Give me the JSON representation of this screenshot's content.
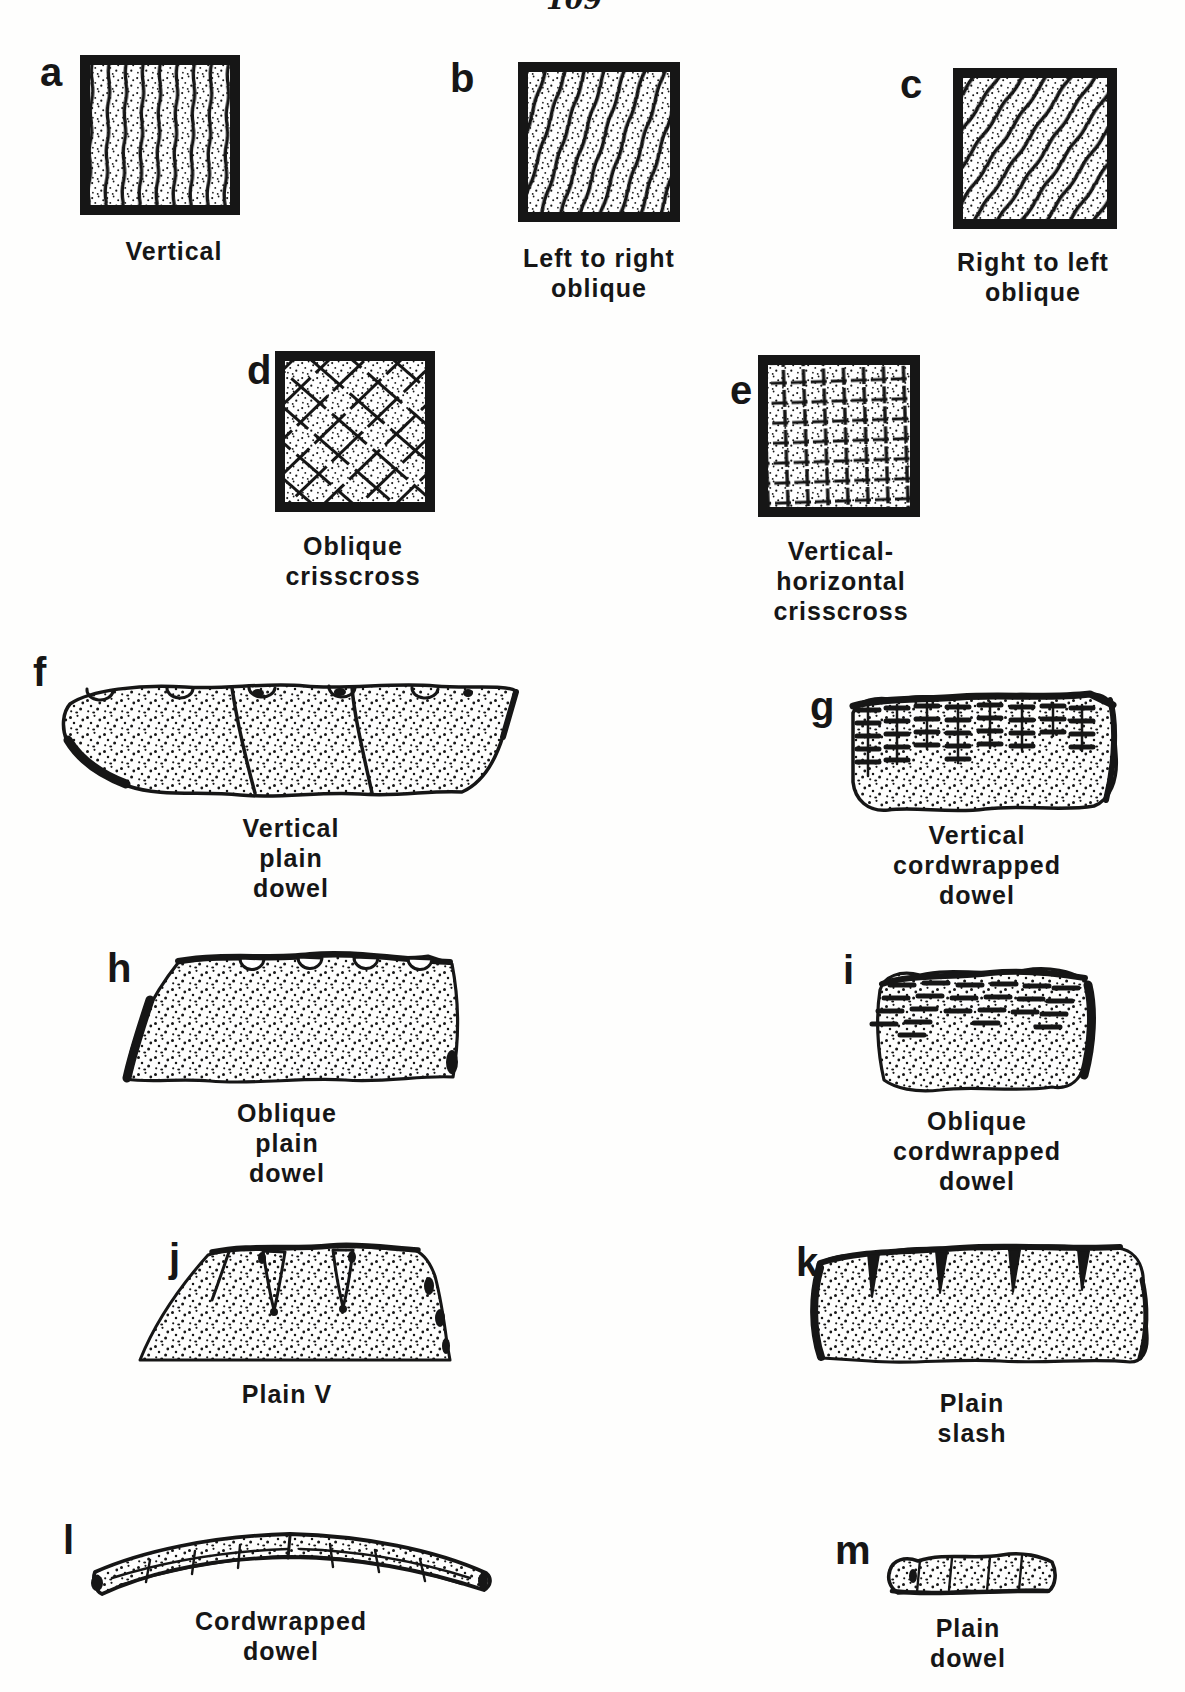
{
  "page": {
    "paper_color": "#fefefd",
    "ink_color": "#161616",
    "page_mark": "109"
  },
  "figure": {
    "panels": [
      {
        "letter": "a",
        "kind": "square-swatch",
        "pattern": "vertical-lines",
        "caption_lines": [
          "Vertical"
        ]
      },
      {
        "letter": "b",
        "kind": "square-swatch",
        "pattern": "steep-oblique-lines",
        "caption_lines": [
          "Left to right",
          "oblique"
        ]
      },
      {
        "letter": "c",
        "kind": "square-swatch",
        "pattern": "oblique-lines",
        "caption_lines": [
          "Right to left",
          "oblique"
        ]
      },
      {
        "letter": "d",
        "kind": "square-swatch",
        "pattern": "diagonal-crisscross",
        "caption_lines": [
          "Oblique",
          "crisscross"
        ]
      },
      {
        "letter": "e",
        "kind": "square-swatch",
        "pattern": "vertical-horizontal-grid",
        "caption_lines": [
          "Vertical-",
          "horizontal",
          "crisscross"
        ]
      },
      {
        "letter": "f",
        "kind": "rim-sherd",
        "pattern": "plain-dowel-impressions-vertical",
        "caption_lines": [
          "Vertical",
          "plain",
          "dowel"
        ]
      },
      {
        "letter": "g",
        "kind": "rim-sherd",
        "pattern": "cordwrapped-dowel-impressions-vertical",
        "caption_lines": [
          "Vertical",
          "cordwrapped",
          "dowel"
        ]
      },
      {
        "letter": "h",
        "kind": "rim-sherd",
        "pattern": "plain-dowel-impressions-oblique",
        "caption_lines": [
          "Oblique",
          "plain",
          "dowel"
        ]
      },
      {
        "letter": "i",
        "kind": "rim-sherd",
        "pattern": "cordwrapped-dowel-impressions-oblique",
        "caption_lines": [
          "Oblique",
          "cordwrapped",
          "dowel"
        ]
      },
      {
        "letter": "j",
        "kind": "rim-sherd",
        "pattern": "v-shaped-grooves",
        "caption_lines": [
          "Plain V"
        ]
      },
      {
        "letter": "k",
        "kind": "rim-sherd",
        "pattern": "slash-marks",
        "caption_lines": [
          "Plain",
          "slash"
        ]
      },
      {
        "letter": "l",
        "kind": "lip-strip",
        "pattern": "cordwrapped-dowel",
        "caption_lines": [
          "Cordwrapped",
          "dowel"
        ]
      },
      {
        "letter": "m",
        "kind": "lip-strip",
        "pattern": "plain-dowel",
        "caption_lines": [
          "Plain",
          "dowel"
        ]
      }
    ]
  }
}
